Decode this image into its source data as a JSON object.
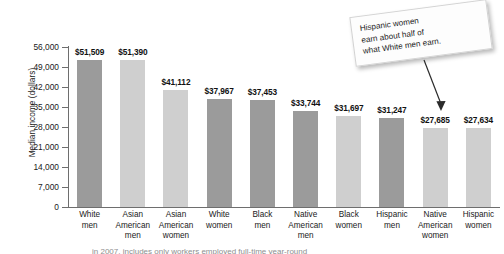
{
  "chart_data": {
    "type": "bar",
    "title": "",
    "xlabel": "",
    "ylabel": "Median income (dollars)",
    "ylim": [
      0,
      56000
    ],
    "ytick_values": [
      56000,
      49000,
      42000,
      35000,
      28000,
      21000,
      14000,
      7000,
      0
    ],
    "ytick_labels": [
      "56,000",
      "49,000",
      "42,000",
      "35,000",
      "28,000",
      "21,000",
      "14,000",
      "7,000",
      "0"
    ],
    "grid": false,
    "legend": null,
    "categories": [
      "White men",
      "Asian American men",
      "Asian American women",
      "White women",
      "Black men",
      "Native American men",
      "Black women",
      "Hispanic men",
      "Native American women",
      "Hispanic women"
    ],
    "category_lines": [
      [
        "White",
        "men"
      ],
      [
        "Asian",
        "American",
        "men"
      ],
      [
        "Asian",
        "American",
        "women"
      ],
      [
        "White",
        "women"
      ],
      [
        "Black",
        "men"
      ],
      [
        "Native",
        "American",
        "men"
      ],
      [
        "Black",
        "women"
      ],
      [
        "Hispanic",
        "men"
      ],
      [
        "Native",
        "American",
        "women"
      ],
      [
        "Hispanic",
        "women"
      ]
    ],
    "values": [
      51509,
      51390,
      41112,
      37967,
      37453,
      33744,
      31697,
      31247,
      27685,
      27634
    ],
    "value_labels": [
      "$51,509",
      "$51,390",
      "$41,112",
      "$37,967",
      "$37,453",
      "$33,744",
      "$31,697",
      "$31,247",
      "$27,685",
      "$27,634"
    ],
    "bar_shades": [
      "dark",
      "light",
      "light",
      "dark",
      "dark",
      "dark",
      "light",
      "dark",
      "light",
      "light"
    ],
    "colors": {
      "bar_dark": "#9b9b9b",
      "bar_light": "#cfcfcf",
      "axis": "#6e6e6e",
      "text": "#1a1a1a",
      "background": "#ffffff"
    },
    "annotations": [
      {
        "text": "Hispanic women earn about half of what White men earn.",
        "points_to": "Hispanic women",
        "style": "tilted note card with arrow"
      }
    ]
  },
  "callout": {
    "line1": "Hispanic women",
    "line2": "earn about half of",
    "line3": "what White men earn."
  },
  "caption": {
    "partial_text": "in 2007, includes only workers employed full-time year-round"
  }
}
